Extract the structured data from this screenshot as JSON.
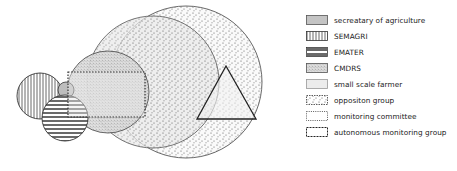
{
  "diagram": {
    "title": "",
    "colors": {
      "stroke": "#333333",
      "secretary_fill": "#c4c4c4",
      "small_farmer_fill": "#ececec",
      "dot_color": "#555555"
    },
    "shapes": [
      {
        "id": "semagri",
        "type": "circle",
        "label": "SEMAGRI",
        "cx": 40,
        "cy": 96,
        "r": 23,
        "pattern": "vertical-stripes"
      },
      {
        "id": "secretary-small",
        "type": "circle",
        "label": "secretary of agriculture",
        "cx": 68,
        "cy": 91,
        "r": 8,
        "pattern": "solid-gray"
      },
      {
        "id": "emater",
        "type": "circle",
        "label": "EMATER",
        "cx": 65,
        "cy": 118,
        "r": 23,
        "pattern": "horizontal-stripes"
      },
      {
        "id": "cmdrs",
        "type": "circle",
        "label": "CMDRS",
        "cx": 108,
        "cy": 92,
        "r": 41,
        "pattern": "dense-stipple"
      },
      {
        "id": "small-scale-farmer",
        "type": "circle",
        "label": "small scale farmer",
        "cx": 153,
        "cy": 82,
        "r": 66,
        "pattern": "light-gray"
      },
      {
        "id": "opposition-group",
        "type": "circle",
        "label": "oppositon group",
        "cx": 186,
        "cy": 82,
        "r": 76,
        "pattern": "dots"
      },
      {
        "id": "monitoring-committee",
        "type": "rect",
        "label": "monitoring committee",
        "x": 67,
        "y": 72,
        "w": 78,
        "h": 45,
        "pattern": "dotted-outline"
      },
      {
        "id": "autonomous-monitoring-group",
        "type": "triangle",
        "label": "autonomous monitoring group",
        "points": "226,66 197,119 256,119",
        "pattern": "outline"
      }
    ]
  },
  "legend": {
    "items": [
      {
        "label": "secreatary of agriculture",
        "swatch": "solid-gray"
      },
      {
        "label": "SEMAGRI",
        "swatch": "vertical-stripes"
      },
      {
        "label": "EMATER",
        "swatch": "horizontal-stripes"
      },
      {
        "label": "CMDRS",
        "swatch": "dense-stipple"
      },
      {
        "label": "small scale farmer",
        "swatch": "light-gray"
      },
      {
        "label": "oppositon group",
        "swatch": "dots"
      },
      {
        "label": "monitoring committee",
        "swatch": "dotted-outline"
      },
      {
        "label": "autonomous monitoring group",
        "swatch": "dashed-outline"
      }
    ]
  }
}
